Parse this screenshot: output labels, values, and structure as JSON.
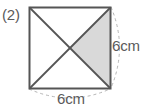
{
  "figure": {
    "item_number": "(2)",
    "shape_name": "square-with-diagonals",
    "label_right": "6cm",
    "label_bottom": "6cm",
    "colors": {
      "outline": "#555555",
      "diagonal": "#555555",
      "shaded_region": "#d9d9d9",
      "dashed_guide": "#b5b5b5",
      "text": "#5a5a5a",
      "background": "#ffffff"
    },
    "geometry": {
      "left": 29,
      "top": 7,
      "right": 110,
      "bottom": 88,
      "center_x": 69.5,
      "center_y": 47.5,
      "side_px": 81
    },
    "icon_names": {
      "square": "square-outline-icon",
      "diagonals": "diagonal-lines-icon",
      "shaded": "shaded-triangle-icon",
      "arc_right": "dashed-arc-right-icon",
      "arc_bottom": "dashed-arc-bottom-icon"
    }
  }
}
